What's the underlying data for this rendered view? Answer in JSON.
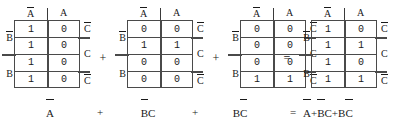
{
  "figure": {
    "kind": "karnaugh-map-sum-of-products",
    "background_color": "#ffffff",
    "ink_color": "#1a1a1a",
    "grid_color": "#4a4a4a"
  },
  "kmaps": [
    {
      "id": "kmap-1",
      "col_headers": [
        "A̅",
        "A"
      ],
      "row_labels": [
        "B̅",
        "B"
      ],
      "right_labels": [
        "C̅",
        "C",
        "C̅"
      ],
      "cells": [
        [
          "1",
          "0"
        ],
        [
          "1",
          "0"
        ],
        [
          "1",
          "0"
        ],
        [
          "1",
          "0"
        ]
      ],
      "term": "A̅"
    },
    {
      "id": "kmap-2",
      "col_headers": [
        "A̅",
        "A"
      ],
      "row_labels": [
        "B̅",
        "B"
      ],
      "right_labels": [
        "C̅",
        "C",
        "C̅"
      ],
      "cells": [
        [
          "0",
          "0"
        ],
        [
          "1",
          "1"
        ],
        [
          "0",
          "0"
        ],
        [
          "0",
          "0"
        ]
      ],
      "term": "B̅C"
    },
    {
      "id": "kmap-3",
      "col_headers": [
        "A̅",
        "A"
      ],
      "row_labels": [
        "B̅",
        "B"
      ],
      "right_labels": [
        "C̅",
        "C",
        "C̅"
      ],
      "cells": [
        [
          "0",
          "0"
        ],
        [
          "0",
          "0"
        ],
        [
          "0",
          "0"
        ],
        [
          "1",
          "1"
        ]
      ],
      "term": "BC̅"
    },
    {
      "id": "kmap-4",
      "col_headers": [
        "A̅",
        "A"
      ],
      "row_labels": [
        "B̅",
        "B"
      ],
      "right_labels": [
        "C̅",
        "C",
        "C̅"
      ],
      "cells": [
        [
          "1",
          "0"
        ],
        [
          "1",
          "1"
        ],
        [
          "1",
          "0"
        ],
        [
          "1",
          "1"
        ]
      ],
      "term": "A̅+B̅C+BC̅"
    }
  ],
  "operators": {
    "plus_1": "+",
    "plus_2": "+",
    "equals": "="
  },
  "equation": {
    "term_1": "A̅",
    "plus_1": "+",
    "term_2": "B̅C",
    "plus_2": "+",
    "term_3": "BC̅",
    "equals": "=",
    "result": "A̅+B̅C+BC̅"
  }
}
